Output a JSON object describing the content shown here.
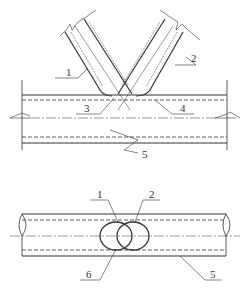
{
  "diagram": {
    "type": "technical-drawing",
    "views": [
      {
        "name": "elevation",
        "labels": [
          {
            "id": "1",
            "text": "1"
          },
          {
            "id": "2",
            "text": "2"
          },
          {
            "id": "3",
            "text": "3"
          },
          {
            "id": "4",
            "text": "4"
          },
          {
            "id": "5",
            "text": "5"
          }
        ]
      },
      {
        "name": "plan",
        "labels": [
          {
            "id": "1",
            "text": "1"
          },
          {
            "id": "2",
            "text": "2"
          },
          {
            "id": "6",
            "text": "6"
          },
          {
            "id": "5",
            "text": "5"
          }
        ]
      }
    ],
    "colors": {
      "line": "#333333",
      "thin_line": "#666666",
      "background": "#ffffff"
    }
  }
}
